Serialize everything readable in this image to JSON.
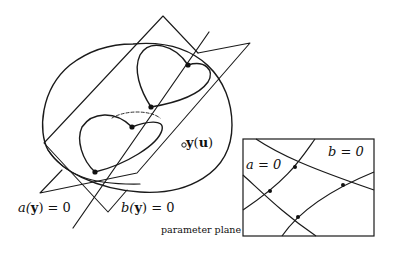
{
  "figure": {
    "labels": {
      "a_plane": {
        "pre": "a(",
        "var": "y",
        "post": ") = 0"
      },
      "b_plane": {
        "pre": "b(",
        "var": "y",
        "post": ") = 0"
      },
      "point": {
        "var": "y",
        "pre": "(",
        "arg": "u",
        "post": ")"
      },
      "param_plane": "parameter plane",
      "a_curve": "a = 0",
      "b_curve": "b = 0"
    },
    "colors": {
      "stroke": "#1a1a1a",
      "background": "#ffffff"
    }
  }
}
